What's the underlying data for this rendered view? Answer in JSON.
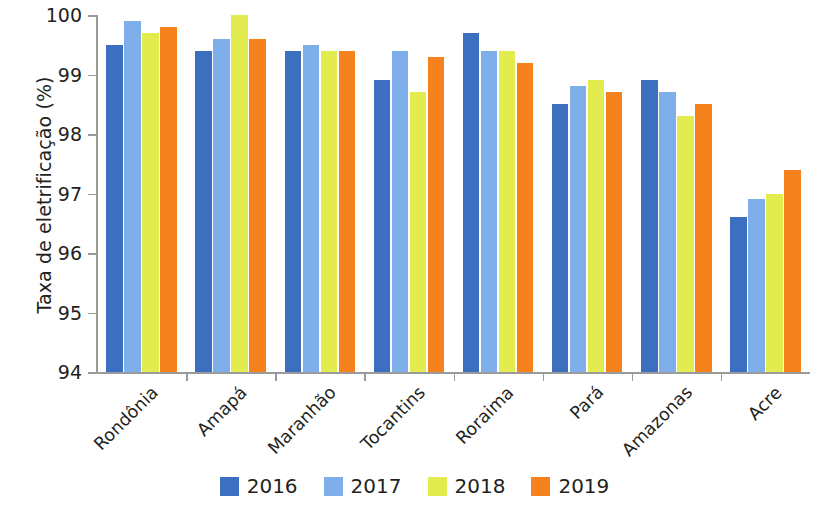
{
  "chart_data": {
    "type": "bar",
    "title": "",
    "subtitle": "",
    "xlabel": "",
    "ylabel": "Taxa de eletrificação (%)",
    "ylim": [
      94,
      100
    ],
    "ytick_labels": [
      "94",
      "95",
      "96",
      "97",
      "98",
      "99",
      "100"
    ],
    "yticks": [
      94,
      95,
      96,
      97,
      98,
      99,
      100
    ],
    "grid": false,
    "legend_position": "bottom",
    "categories": [
      "Rondônia",
      "Amapá",
      "Maranhão",
      "Tocantins",
      "Roraima",
      "Pará",
      "Amazonas",
      "Acre"
    ],
    "series": [
      {
        "name": "2016",
        "color": "#3D6FC0",
        "values": [
          99.5,
          99.4,
          99.4,
          98.9,
          99.7,
          98.5,
          98.9,
          96.6
        ]
      },
      {
        "name": "2017",
        "color": "#7FAFEA",
        "values": [
          99.9,
          99.6,
          99.5,
          99.4,
          99.4,
          98.8,
          98.7,
          96.9
        ]
      },
      {
        "name": "2018",
        "color": "#E3EC4F",
        "values": [
          99.7,
          100.0,
          99.4,
          98.7,
          99.4,
          98.9,
          98.3,
          97.0
        ]
      },
      {
        "name": "2019",
        "color": "#F6821E",
        "values": [
          99.8,
          99.6,
          99.4,
          99.3,
          99.2,
          98.7,
          98.5,
          97.4
        ]
      }
    ]
  },
  "legend": {
    "items": [
      {
        "label": "2016",
        "color": "#3D6FC0"
      },
      {
        "label": "2017",
        "color": "#7FAFEA"
      },
      {
        "label": "2018",
        "color": "#E3EC4F"
      },
      {
        "label": "2019",
        "color": "#F6821E"
      }
    ]
  },
  "colors": {
    "axis": "#9a9a9a",
    "text": "#231f20",
    "background": "#ffffff"
  }
}
